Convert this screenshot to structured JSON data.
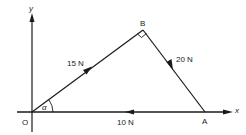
{
  "diagram": {
    "axes": {
      "x_label": "x",
      "y_label": "y",
      "origin_label": "O"
    },
    "points": {
      "O": "O",
      "A": "A",
      "B": "B"
    },
    "forces": [
      {
        "id": "OB",
        "label": "15 N",
        "from": "O",
        "to": "B"
      },
      {
        "id": "BA",
        "label": "20 N",
        "from": "B",
        "to": "A"
      },
      {
        "id": "AO",
        "label": "10 N",
        "from": "A",
        "to": "O"
      }
    ],
    "angle_label": "α",
    "right_angle_at": "B",
    "colors": {
      "stroke": "#1a1a1a",
      "background": "#ffffff"
    }
  }
}
